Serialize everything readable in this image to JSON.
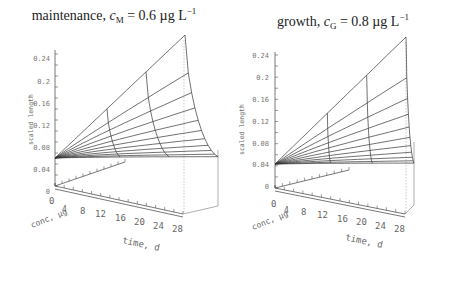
{
  "chart_data": [
    {
      "type": "surface3d",
      "title": "maintenance, c_M = 0.6 µg L^-1",
      "title_parts": {
        "prefix": "maintenance, ",
        "var": "c",
        "sub": "M",
        "rest": " = 0.6 µg L",
        "sup": "−1"
      },
      "zlabel": "scaled length",
      "xlabel": "time, d",
      "ylabel": "conc, µg",
      "z_ticks": [
        "0",
        "0.04",
        "0.08",
        "0.12",
        "0.16",
        "0.2",
        "0.24"
      ],
      "x_ticks": [
        "0",
        "4",
        "8",
        "12",
        "16",
        "20",
        "24",
        "28"
      ],
      "y_ticks": [
        "2",
        "4",
        "6",
        "8",
        "10"
      ],
      "zlim": [
        0,
        0.24
      ],
      "xlim": [
        0,
        28
      ],
      "start_length": 0.04,
      "peak_length": 0.245
    },
    {
      "type": "surface3d",
      "title": "growth, c_G = 0.8 µg L^-1",
      "title_parts": {
        "prefix": "growth, ",
        "var": "c",
        "sub": "G",
        "rest": " = 0.8 µg L",
        "sup": "−1"
      },
      "zlabel": "scaled length",
      "xlabel": "time, d",
      "ylabel": "conc, µg",
      "z_ticks": [
        "0",
        "0.04",
        "0.08",
        "0.12",
        "0.16",
        "0.2",
        "0.24"
      ],
      "x_ticks": [
        "0",
        "4",
        "8",
        "12",
        "16",
        "20",
        "24",
        "28"
      ],
      "y_ticks": [
        "2",
        "4",
        "6",
        "8",
        "10"
      ],
      "zlim": [
        0,
        0.24
      ],
      "xlim": [
        0,
        28
      ],
      "start_length": 0.04,
      "peak_length": 0.245
    }
  ],
  "labels": {
    "z": "scaled length",
    "conc": "conc, µg",
    "time": "time, d"
  }
}
